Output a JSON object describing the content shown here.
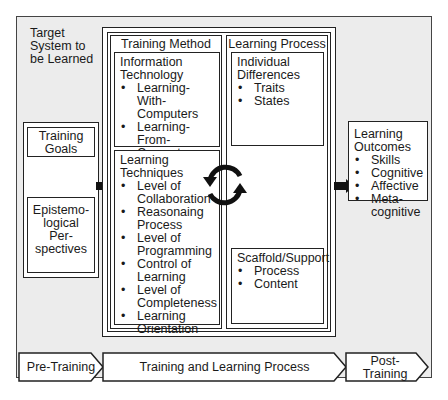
{
  "outer": {
    "label": "Target System to be Learned",
    "label_lines": [
      "Target",
      "System to",
      "be Learned"
    ]
  },
  "left": {
    "training_goals": {
      "label": "Training Goals",
      "lines": [
        "Training",
        "Goals"
      ]
    },
    "epistemological": {
      "label": "Epistemological Perspectives",
      "lines": [
        "Epistemo-",
        "logical",
        "Per-",
        "spectives"
      ]
    }
  },
  "training_method": {
    "title": "Training Method",
    "information_technology": {
      "title_lines": [
        "Information",
        "Technology"
      ],
      "items": [
        "Learning-With-Computers",
        "Learning-From-Computers"
      ],
      "items_display": [
        [
          "Learning-With-",
          "Computers"
        ],
        [
          "Learning-",
          "From-",
          "Computers"
        ]
      ]
    },
    "learning_techniques": {
      "title_lines": [
        "Learning",
        "Techniques"
      ],
      "items": [
        "Level of Collaboration",
        "Reasonaing Process",
        "Level of Programming",
        "Control of Learning",
        "Level of Completeness",
        "Learning Orientation"
      ],
      "items_display": [
        [
          "Level of",
          "Collaboration"
        ],
        [
          "Reasonaing",
          "Process"
        ],
        [
          "Level of",
          "Programming"
        ],
        [
          "Control of",
          "Learning"
        ],
        [
          "Level of",
          "Completeness"
        ],
        [
          "Learning",
          "Orientation"
        ]
      ]
    }
  },
  "learning_process": {
    "title": "Learning Process",
    "individual_differences": {
      "title_lines": [
        "Individual",
        "Differences"
      ],
      "items": [
        "Traits",
        "States"
      ]
    },
    "scaffold_support": {
      "title": "Scaffold/Support",
      "items": [
        "Process",
        "Content"
      ]
    }
  },
  "learning_outcomes": {
    "title_lines": [
      "Learning",
      "Outcomes"
    ],
    "items": [
      "Skills",
      "Cognitive",
      "Affective",
      "Metacognitive"
    ],
    "items_display": [
      [
        "Skills"
      ],
      [
        "Cognitive"
      ],
      [
        "Affective"
      ],
      [
        "Meta-",
        "cognitive"
      ]
    ]
  },
  "phases": [
    {
      "label": "Pre-Training"
    },
    {
      "label": "Training and Learning Process"
    },
    {
      "label": "Post-Training",
      "lines": [
        "Post-",
        "Training"
      ]
    }
  ],
  "icons": {
    "cycle": "circular-arrows-icon",
    "flow": "right-arrow-icon"
  }
}
